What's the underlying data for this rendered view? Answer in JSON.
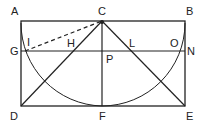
{
  "diagram": {
    "type": "geometric construction",
    "stroke_color": "#222222",
    "background": "#ffffff",
    "points": {
      "A": "A",
      "B": "B",
      "C": "C",
      "D": "D",
      "E": "E",
      "F": "F",
      "G": "G",
      "H": "H",
      "I": "I",
      "L": "L",
      "O": "O",
      "N": "N",
      "P": "P"
    },
    "elements": [
      "rectangle ABED",
      "segment GN (horizontal)",
      "segment CF (vertical)",
      "segment CD",
      "segment CE",
      "dashed segment IC",
      "semicircle arc from A through F to B centered at C"
    ]
  }
}
